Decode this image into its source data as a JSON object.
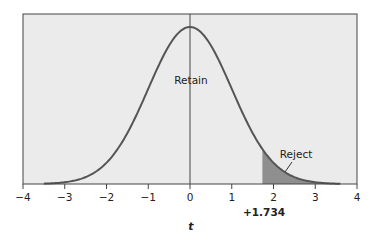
{
  "chart_data": {
    "type": "area",
    "title": "",
    "xlabel": "t",
    "ylabel": "",
    "xlim": [
      -4,
      4
    ],
    "x_ticks": [
      -4,
      -3,
      -2,
      -1,
      0,
      1,
      2,
      3,
      4
    ],
    "x_tick_labels": [
      "−4",
      "−3",
      "−2",
      "−1",
      "0",
      "1",
      "2",
      "3",
      "4"
    ],
    "grid": false,
    "legend": null,
    "curve": {
      "name": "t distribution",
      "x_range": [
        -3.5,
        3.6
      ],
      "peak_x": 0
    },
    "critical_value": 1.734,
    "critical_value_label": "+1.734",
    "regions": [
      {
        "name": "Retain",
        "label": "Retain",
        "from": -4,
        "to": 1.734,
        "shaded": false
      },
      {
        "name": "Reject",
        "label": "Reject",
        "from": 1.734,
        "to": 4,
        "shaded": true
      }
    ],
    "annotations": [
      "Retain",
      "Reject",
      "+1.734"
    ]
  },
  "colors": {
    "plot_background": "#ebebeb",
    "curve": "#555555",
    "reject_fill": "#8f8f8f",
    "axis": "#444444"
  }
}
